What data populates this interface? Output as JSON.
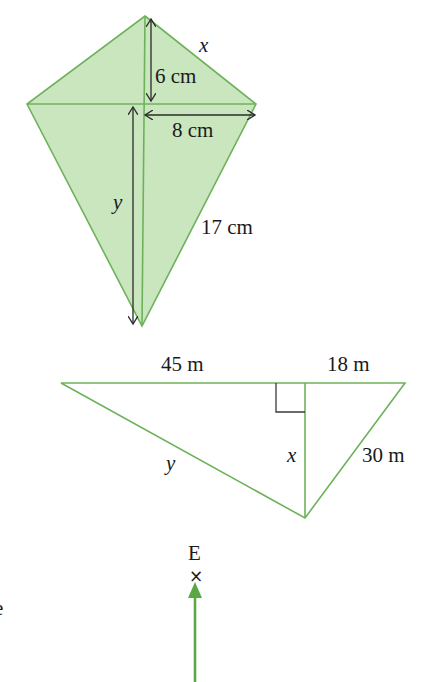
{
  "colors": {
    "fill": "#c9e6bf",
    "stroke": "#6db25a",
    "arrow_dark": "#2a2a2a",
    "arrow_green": "#5aa845"
  },
  "kite": {
    "label_x": "x",
    "label_6cm": "6 cm",
    "label_8cm": "8 cm",
    "label_y": "y",
    "label_17cm": "17 cm"
  },
  "triangle": {
    "label_45m": "45 m",
    "label_18m": "18 m",
    "label_y": "y",
    "label_x": "x",
    "label_30m": "30 m"
  },
  "point": {
    "label_E": "E",
    "marker": "×"
  },
  "cropped_text": {
    "left_edge_fragment": "e"
  }
}
